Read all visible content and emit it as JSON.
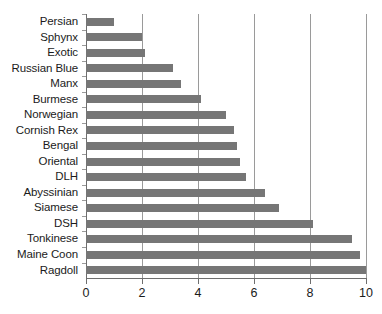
{
  "chart_data": {
    "type": "bar",
    "orientation": "horizontal",
    "title": "",
    "subtitle": "",
    "xlabel": "",
    "ylabel": "",
    "xlim": [
      0,
      10
    ],
    "ylim": null,
    "grid": "vertical",
    "legend": null,
    "bar_color": "#767676",
    "axis_color": "#6e6e6e",
    "gridline_color": "#9a9a9a",
    "background": "#ffffff",
    "xticks": [
      0,
      2,
      4,
      6,
      8,
      10
    ],
    "xtick_labels": [
      "0",
      "2",
      "4",
      "6",
      "8",
      "10"
    ],
    "categories": [
      "Persian",
      "Sphynx",
      "Exotic",
      "Russian Blue",
      "Manx",
      "Burmese",
      "Norwegian",
      "Cornish Rex",
      "Bengal",
      "Oriental",
      "DLH",
      "Abyssinian",
      "Siamese",
      "DSH",
      "Tonkinese",
      "Maine Coon",
      "Ragdoll"
    ],
    "values": [
      1.0,
      2.0,
      2.1,
      3.1,
      3.4,
      4.1,
      5.0,
      5.3,
      5.4,
      5.5,
      5.7,
      6.4,
      6.9,
      8.1,
      9.5,
      9.8,
      10.0
    ]
  }
}
